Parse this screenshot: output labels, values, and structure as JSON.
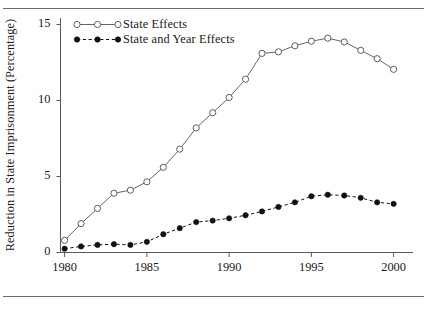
{
  "chart_data": {
    "type": "line",
    "title": "",
    "xlabel": "",
    "ylabel": "Reduction in State Imprisonment (Percentage)",
    "xlim": [
      1979.3,
      2000.9
    ],
    "ylim": [
      -0.55,
      15.8
    ],
    "xticks": [
      1980,
      1985,
      1990,
      1995,
      2000
    ],
    "xtick_labels": [
      "1980",
      "1985",
      "1990",
      "1995",
      "2000"
    ],
    "yticks": [
      0,
      5,
      10,
      15
    ],
    "ytick_labels": [
      "0",
      "5",
      "10",
      "15"
    ],
    "grid": false,
    "legend_position": "top-left-inside",
    "x": [
      1980,
      1981,
      1982,
      1983,
      1984,
      1985,
      1986,
      1987,
      1988,
      1989,
      1990,
      1991,
      1992,
      1993,
      1994,
      1995,
      1996,
      1997,
      1998,
      1999,
      2000
    ],
    "series": [
      {
        "name": "State Effects",
        "marker": "open-circle",
        "linestyle": "solid",
        "color": "#555555",
        "values": [
          0.8,
          1.9,
          2.9,
          3.9,
          4.1,
          4.65,
          5.6,
          6.8,
          8.2,
          9.2,
          10.2,
          11.4,
          13.1,
          13.2,
          13.6,
          13.9,
          14.1,
          13.85,
          13.3,
          12.75,
          12.05
        ]
      },
      {
        "name": "State and Year Effects",
        "marker": "filled-circle",
        "linestyle": "dashed",
        "color": "#111111",
        "values": [
          0.25,
          0.4,
          0.5,
          0.55,
          0.5,
          0.7,
          1.2,
          1.6,
          2.0,
          2.1,
          2.25,
          2.45,
          2.7,
          3.0,
          3.3,
          3.7,
          3.8,
          3.75,
          3.6,
          3.3,
          3.2
        ]
      }
    ]
  },
  "axis": {
    "y_label": "Reduction in State Imprisonment (Percentage)",
    "y_tick_0": "0",
    "y_tick_1": "5",
    "y_tick_2": "10",
    "y_tick_3": "15",
    "x_tick_0": "1980",
    "x_tick_1": "1985",
    "x_tick_2": "1990",
    "x_tick_3": "1995",
    "x_tick_4": "2000"
  },
  "legend": {
    "entry_1": "State Effects",
    "entry_2": "State and Year Effects"
  },
  "colors": {
    "rule": "#6d6d6d",
    "axis": "#5a5a5a",
    "series_1": "#555555",
    "series_2": "#111111",
    "text": "#1a1a1a"
  }
}
